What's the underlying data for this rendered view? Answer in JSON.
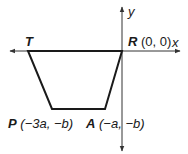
{
  "figure": {
    "type": "coordinate-geometry-diagram",
    "shape": "trapezoid",
    "axes": {
      "x_label": "x",
      "y_label": "y"
    },
    "vertices": [
      {
        "name": "T",
        "label": "T",
        "coords": ""
      },
      {
        "name": "R",
        "label": "R",
        "coords": "(0, 0)"
      },
      {
        "name": "A",
        "label": "A",
        "coords": "(−a, −b)"
      },
      {
        "name": "P",
        "label": "P",
        "coords": "(−3a, −b)"
      }
    ],
    "colors": {
      "line": "#1a1a1a",
      "axis": "#333333",
      "background": "#ffffff"
    }
  }
}
